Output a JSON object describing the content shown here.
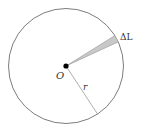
{
  "diagram": {
    "type": "circle-sector",
    "labels": {
      "center": "O",
      "radius": "r",
      "arc": "ΔL"
    },
    "colors": {
      "circle_stroke": "#6e6e6e",
      "radius_stroke": "#9a9a9a",
      "sector_fill": "#c8c8c8",
      "sector_stroke": "#8a8a8a",
      "center_dot": "#000000",
      "label": "#333333"
    }
  }
}
